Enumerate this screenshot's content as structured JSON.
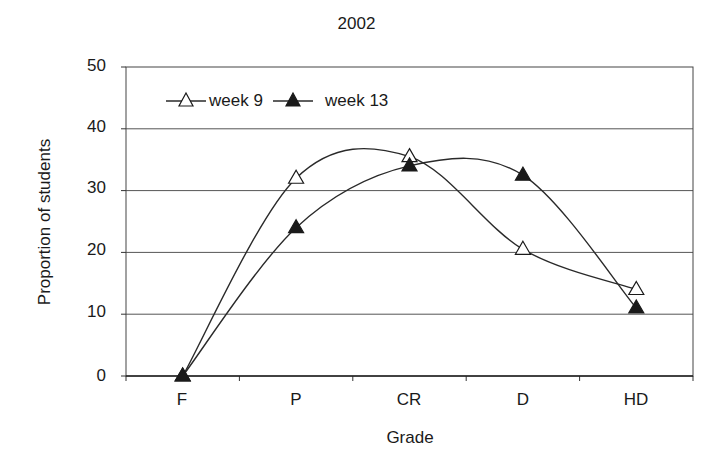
{
  "chart_data": {
    "type": "line",
    "title": "2002",
    "xlabel": "Grade",
    "ylabel": "Proportion of students",
    "categories": [
      "F",
      "P",
      "CR",
      "D",
      "HD"
    ],
    "series": [
      {
        "name": "week 9",
        "marker": "open-triangle",
        "values": [
          0,
          32,
          35.5,
          20.5,
          14
        ]
      },
      {
        "name": "week 13",
        "marker": "filled-triangle",
        "values": [
          0,
          24,
          34,
          32.5,
          11
        ]
      }
    ],
    "ylim": [
      0,
      50
    ],
    "yticks": [
      0,
      10,
      20,
      30,
      40,
      50
    ],
    "grid": "horizontal",
    "smoothed": true,
    "legend_position": "top-left inside plot"
  },
  "labels": {
    "title": "2002",
    "xlabel": "Grade",
    "ylabel": "Proportion of students",
    "yticks": [
      "50",
      "40",
      "30",
      "20",
      "10",
      "0"
    ],
    "xticks": [
      "F",
      "P",
      "CR",
      "D",
      "HD"
    ],
    "legend": [
      "week 9",
      "week 13"
    ]
  },
  "colors": {
    "line": "#2a2a2a",
    "grid": "#555555",
    "marker_fill_week13": "#1a1a1a",
    "marker_fill_week9": "#ffffff"
  }
}
